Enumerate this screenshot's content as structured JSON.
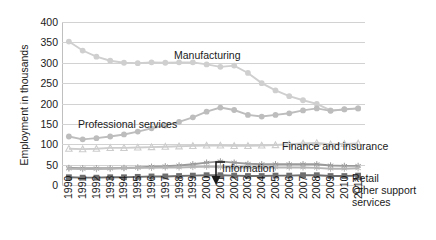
{
  "chart_data": {
    "type": "line",
    "title": "",
    "xlabel": "",
    "ylabel": "Employment in thousands",
    "ylim": [
      0,
      400
    ],
    "ytick_step": 50,
    "yticks": [
      400,
      350,
      300,
      250,
      200,
      150,
      100,
      50,
      0
    ],
    "grid": true,
    "legend_position": "inline-annotations",
    "x": [
      1990,
      1991,
      1992,
      1993,
      1994,
      1995,
      1996,
      1997,
      1998,
      1999,
      2000,
      2001,
      2002,
      2003,
      2004,
      2005,
      2006,
      2007,
      2008,
      2009,
      2010,
      2011
    ],
    "series": [
      {
        "name": "Manufacturing",
        "color": "#cfcfcf",
        "marker": "circle",
        "values": [
          352,
          330,
          315,
          305,
          300,
          299,
          301,
          300,
          301,
          301,
          296,
          290,
          293,
          275,
          250,
          232,
          218,
          208,
          199,
          183,
          185,
          188
        ]
      },
      {
        "name": "Professional services",
        "color": "#bdbdbd",
        "marker": "circle",
        "values": [
          119,
          112,
          115,
          119,
          124,
          131,
          139,
          146,
          155,
          166,
          180,
          190,
          184,
          172,
          168,
          172,
          176,
          183,
          188,
          182,
          186,
          188
        ]
      },
      {
        "name": "Finance and insurance",
        "color": "#cdcdcd",
        "marker": "triangle",
        "values": [
          89,
          88,
          89,
          91,
          91,
          92,
          93,
          94,
          95,
          96,
          97,
          97,
          96,
          96,
          97,
          98,
          100,
          102,
          103,
          100,
          101,
          102
        ]
      },
      {
        "name": "Information",
        "color": "#9a9a9a",
        "marker": "star",
        "values": [
          42,
          41,
          41,
          41,
          42,
          43,
          45,
          46,
          48,
          51,
          55,
          58,
          55,
          52,
          51,
          51,
          51,
          51,
          51,
          48,
          47,
          47
        ]
      },
      {
        "name": "Retail",
        "color": "#b5b5b5",
        "marker": "star",
        "values": [
          40,
          39,
          39,
          40,
          41,
          42,
          42,
          43,
          43,
          44,
          45,
          44,
          43,
          43,
          43,
          43,
          43,
          43,
          42,
          40,
          40,
          41
        ]
      },
      {
        "name": "Other support services",
        "color": "#6e6e6e",
        "marker": "square",
        "values": [
          19,
          18,
          18,
          19,
          19,
          20,
          21,
          21,
          22,
          23,
          24,
          24,
          23,
          22,
          22,
          23,
          23,
          24,
          24,
          22,
          22,
          23
        ]
      }
    ],
    "annotations": [
      {
        "text": "Manufacturing",
        "target_series": "Manufacturing"
      },
      {
        "text": "Professional services",
        "target_series": "Professional services"
      },
      {
        "text": "Finance and insurance",
        "target_series": "Finance and insurance"
      },
      {
        "text": "Information",
        "target_series": "Information",
        "arrow": "down-left"
      },
      {
        "text": "Retail",
        "target_series": "Retail"
      },
      {
        "text": "Other support services",
        "target_series": "Other support services"
      }
    ]
  },
  "axis": {
    "y_title": "Employment in thousands",
    "y_tick_labels": [
      "400",
      "350",
      "300",
      "250",
      "200",
      "150",
      "100",
      "50",
      "0"
    ],
    "x_tick_labels": [
      "1990",
      "1991",
      "1992",
      "1993",
      "1994",
      "1995",
      "1996",
      "1997",
      "1998",
      "1999",
      "2000",
      "2001",
      "2002",
      "2003",
      "2004",
      "2005",
      "2006",
      "2007",
      "2008",
      "2009",
      "2010",
      "2011"
    ]
  },
  "labels": {
    "manufacturing": "Manufacturing",
    "professional_services": "Professional services",
    "finance_and_insurance": "Finance and insurance",
    "information": "Information",
    "retail": "Retail",
    "other_support_line1": "Other support",
    "other_support_line2": "services"
  }
}
